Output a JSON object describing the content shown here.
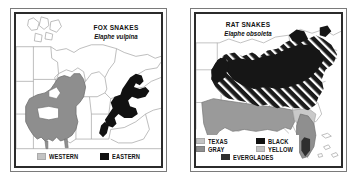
{
  "figure": {
    "kind": "two-panel range map",
    "background": "#ffffff"
  },
  "panels": [
    {
      "id": "fox-snakes",
      "title_common": "FOX SNAKES",
      "title_scientific": "Elaphe vulpina",
      "region": "Upper Midwest and Great Lakes, United States",
      "legend": [
        {
          "label": "WESTERN",
          "swatch": "light-gray",
          "color": "#c3c3c3"
        },
        {
          "label": "EASTERN",
          "swatch": "black",
          "color": "#111111"
        }
      ]
    },
    {
      "id": "rat-snakes",
      "title_common": "RAT SNAKES",
      "title_scientific": "Elaphe obsoleta",
      "region": "Eastern and central United States",
      "legend": [
        {
          "label": "TEXAS",
          "swatch": "light-gray",
          "color": "#c3c3c3"
        },
        {
          "label": "BLACK",
          "swatch": "black",
          "color": "#111111"
        },
        {
          "label": "GRAY",
          "swatch": "mid-gray",
          "color": "#8e8e8e"
        },
        {
          "label": "YELLOW",
          "swatch": "lighter-gray",
          "color": "#cfcfcf"
        },
        {
          "label": "EVERGLADES",
          "swatch": "dark-gray",
          "color": "#2f2f2f"
        }
      ]
    }
  ],
  "colors": {
    "frame": "#2b2b2b",
    "outer_frame": "#7a7a7a",
    "paper": "#ffffff",
    "state_line": "#9b9b9b",
    "range_gray": "#8e8e8e",
    "range_light": "#c3c3c3",
    "range_black": "#111111",
    "hatch_line": "#ffffff"
  }
}
